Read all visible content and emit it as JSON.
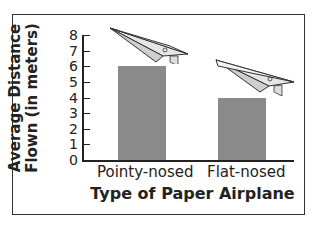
{
  "chart_data": {
    "type": "bar",
    "title": "",
    "categories": [
      "Pointy-nosed",
      "Flat-nosed"
    ],
    "values": [
      6,
      4
    ],
    "xlabel": "Type of Paper Airplane",
    "ylabel": "Average Distance Flown (in meters)",
    "ylabel_lines": [
      "Average Distance",
      "Flown (in meters)"
    ],
    "ylim": [
      0,
      8
    ],
    "yticks": [
      "0",
      "1",
      "2",
      "3",
      "4",
      "5",
      "6",
      "7",
      "8"
    ],
    "grid": false,
    "bar_color": "#8a8a8a",
    "annotations": [
      "paper-airplane illustration above each bar"
    ]
  }
}
